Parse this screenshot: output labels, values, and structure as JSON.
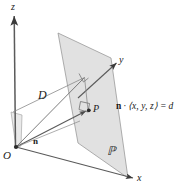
{
  "figure": {
    "background_color": "#ffffff",
    "stroke_color": "#555555",
    "plane_fill_color": "#d8d8d8",
    "text_color": "#1a1a1a"
  },
  "axes": {
    "z_label": "z",
    "y_label": "y",
    "x_label": "x"
  },
  "labels": {
    "origin": "O",
    "distance": "D",
    "point": "P",
    "normal_vector": "n",
    "plane_name": "ℙ"
  },
  "equation": {
    "normal": "n",
    "dot": "·",
    "vector": "⟨x, y, z⟩",
    "equals": "=",
    "value": "d",
    "full": "n · ⟨x, y, z⟩ = d"
  },
  "geometry": {
    "origin_point": [
      16,
      147
    ],
    "plane_corners": [
      [
        58,
        33
      ],
      [
        111,
        58
      ],
      [
        128,
        178
      ],
      [
        78,
        143
      ]
    ],
    "point_P": [
      89,
      110
    ],
    "foot_corner": [
      85,
      77
    ],
    "z_axis_tip": [
      14,
      14
    ],
    "y_axis_tip": [
      118,
      62
    ],
    "x_axis_tip": [
      135,
      178
    ]
  }
}
